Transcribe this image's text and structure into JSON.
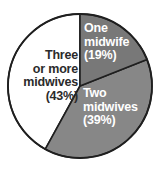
{
  "chart_data": {
    "type": "pie",
    "title": "",
    "subtitle": "",
    "xlabel": "",
    "ylabel": "",
    "legend_position": "none",
    "grid": false,
    "labels_inside_slices": true,
    "start_angle_deg": 0,
    "direction": "clockwise",
    "categories": [
      "One midwife",
      "Two midwives",
      "Three or more midwives"
    ],
    "values": [
      19,
      39,
      43
    ],
    "value_unit": "percent",
    "slices": [
      {
        "name": "One midwife",
        "label_lines": [
          "One",
          "midwife",
          "(19%)"
        ],
        "percent": 19,
        "percent_text": "(19%)",
        "color": "#787878",
        "text_color": "#ffffff",
        "start_angle_deg": 0,
        "end_angle_deg": 68.4
      },
      {
        "name": "Two midwives",
        "label_lines": [
          "Two",
          "midwives",
          "(39%)"
        ],
        "percent": 39,
        "percent_text": "(39%)",
        "color": "#878787",
        "text_color": "#ffffff",
        "start_angle_deg": 68.4,
        "end_angle_deg": 208.8
      },
      {
        "name": "Three or more midwives",
        "label_lines": [
          "Three",
          "or more",
          "midwives",
          "(43%)"
        ],
        "percent": 43,
        "percent_text": "(43%)",
        "color": "#ffffff",
        "text_color": "#2b2b2b",
        "start_angle_deg": 208.8,
        "end_angle_deg": 360
      }
    ]
  },
  "labels": {
    "one_midwife": "One\nmidwife\n(19%)",
    "two_midwives": "Two\nmidwives\n(39%)",
    "three_or_more_midwives": "Three\nor more\nmidwives\n(43%)"
  },
  "style": {
    "background": "#ffffff",
    "outline_color": "#1f1f1f",
    "slice_one_color": "#787878",
    "slice_two_color": "#878787",
    "slice_three_color": "#ffffff"
  },
  "geometry": {
    "center_x": 80,
    "center_y": 86,
    "radius": 72
  }
}
